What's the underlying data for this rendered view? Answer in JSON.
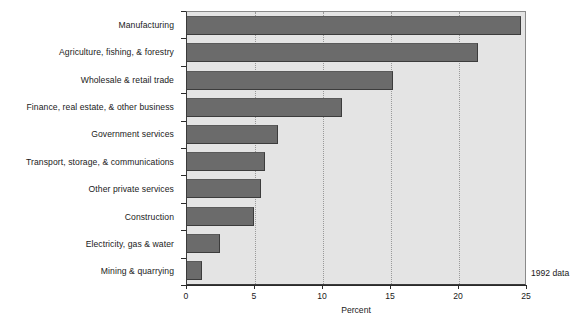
{
  "chart_data": {
    "type": "bar",
    "orientation": "horizontal",
    "title": "",
    "subtitle": "",
    "xlabel": "Percent",
    "ylabel": "",
    "xlim": [
      0,
      25
    ],
    "xticks": [
      0,
      5,
      10,
      15,
      20,
      25
    ],
    "xtick_labels": [
      "0",
      "5",
      "10",
      "15",
      "20",
      "25"
    ],
    "grid": "vertical-dotted",
    "legend": "none",
    "annotation": "1992 data",
    "categories": [
      "Manufacturing",
      "Agriculture, fishing, & forestry",
      "Wholesale & retail trade",
      "Finance, real estate, & other business",
      "Government services",
      "Transport, storage, & communications",
      "Other private services",
      "Construction",
      "Electricity, gas & water",
      "Mining & quarrying"
    ],
    "values": [
      24.6,
      21.5,
      15.2,
      11.5,
      6.8,
      5.8,
      5.5,
      5.0,
      2.5,
      1.2
    ],
    "series": [
      {
        "name": "Percent",
        "values": [
          24.6,
          21.5,
          15.2,
          11.5,
          6.8,
          5.8,
          5.5,
          5.0,
          2.5,
          1.2
        ]
      }
    ],
    "colors": {
      "bar_fill": "#6b6b6b",
      "bar_edge": "#3c3c3c",
      "plot_background": "#e4e4e4",
      "gridline": "#9a9a9a",
      "axis": "#2a2a2a",
      "text": "#1a1a1a",
      "page_background": "#ffffff"
    }
  }
}
